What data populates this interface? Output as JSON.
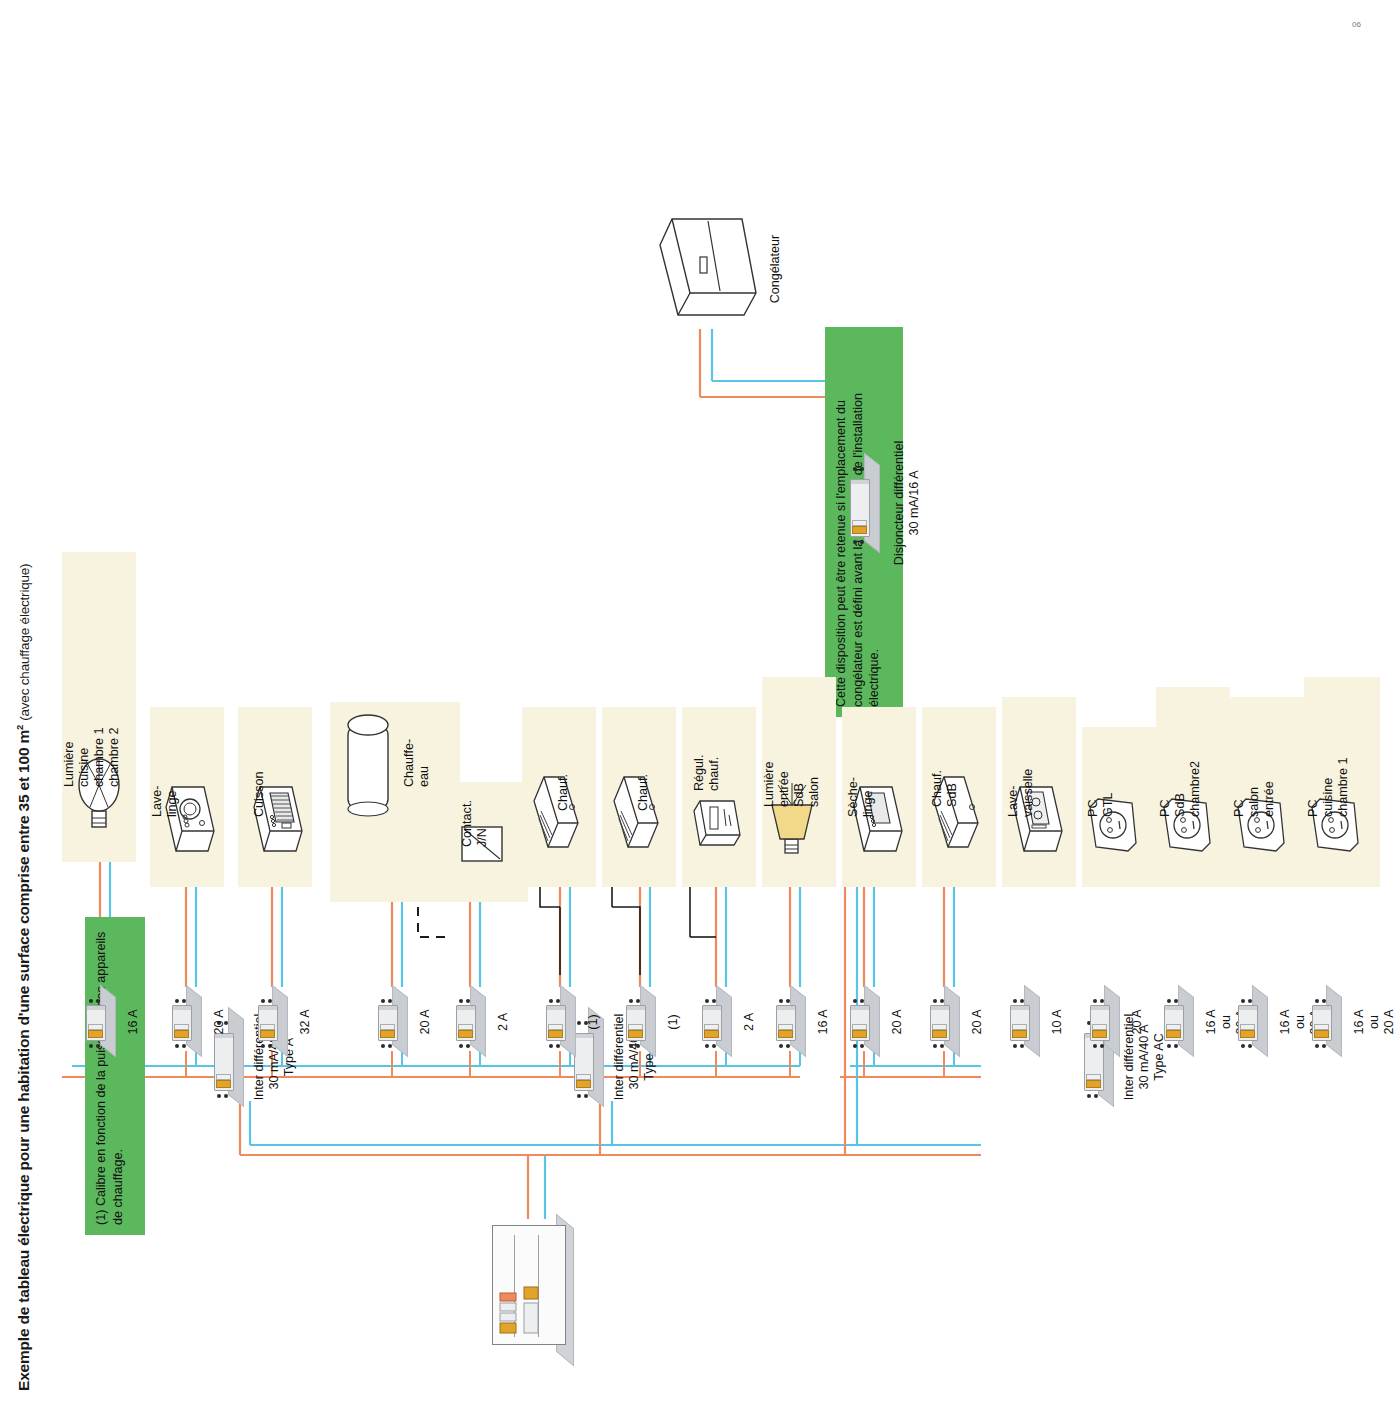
{
  "title": {
    "main": "Exemple de tableau électrique pour une habitation d'une surface comprise entre 35 et 100 m",
    "exponent": "2",
    "sub": "(avec chauffage électrique)"
  },
  "notes": {
    "note1": "(1) Calibre en fonction de la puissance des appareils de chauffage.",
    "note2": "Cette disposition peut être retenue si l'emplacement du congélateur est défini avant la réalisation de l'installation électrique."
  },
  "colors": {
    "note_green": "#5cb85c",
    "card_beige": "#f7f3de",
    "wire_phase": "#f08a5d",
    "wire_neutral": "#58c5e8",
    "wire_control": "#1a1a1a",
    "device_grey": "#c9cdd2",
    "lever_orange": "#e2a32b"
  },
  "interrupteurs": [
    {
      "id": "id-a",
      "line1": "Inter différentiel",
      "line2": "30 mA/40 A",
      "line3": "Type A"
    },
    {
      "id": "id-ac-1",
      "line1": "Inter différentiel",
      "line2": "30 mA/40 A",
      "line3": "Type AC"
    },
    {
      "id": "id-ac-2",
      "line1": "Inter différentiel",
      "line2": "30 mA/40 A",
      "line3": "Type AC"
    }
  ],
  "disjoncteur_differentiel": {
    "line1": "Disjoncteur différentiel",
    "line2": "30 mA/16 A"
  },
  "congelateur": {
    "label": "Congélateur"
  },
  "groups": [
    {
      "name": "group-type-a",
      "circuits": [
        {
          "amp": "16 A",
          "label": [
            "Lumière",
            "cuisine",
            "chambre 1",
            "chambre 2"
          ],
          "icon": "lamp-bulb-icon"
        },
        {
          "amp": "20 A",
          "label": [
            "Lave-",
            "linge"
          ],
          "icon": "washing-machine-icon"
        },
        {
          "amp": "32 A",
          "label": [
            "Cuisson"
          ],
          "icon": "cooker-icon"
        },
        {
          "amp": "20 A",
          "label": [
            "Chauffe-",
            "eau"
          ],
          "icon": "water-heater-icon"
        },
        {
          "amp": "2 A",
          "label": [
            "Contact.",
            "J/N"
          ],
          "icon": "contactor-icon"
        }
      ]
    },
    {
      "name": "group-type-ac-1",
      "circuits": [
        {
          "amp": "(1)",
          "label": [
            "Chauf."
          ],
          "icon": "convector-icon"
        },
        {
          "amp": "(1)",
          "label": [
            "Chauf."
          ],
          "icon": "convector-icon"
        },
        {
          "amp": "2 A",
          "label": [
            "Régul.",
            "chauf."
          ],
          "icon": "thermostat-icon"
        },
        {
          "amp": "16 A",
          "label": [
            "Lumière",
            "entrée",
            "SdB",
            "salon"
          ],
          "icon": "lamp-wall-icon"
        },
        {
          "amp": "20 A",
          "label": [
            "Sèche-",
            "linge"
          ],
          "icon": "tumble-dryer-icon"
        }
      ]
    },
    {
      "name": "group-type-ac-2",
      "circuits": [
        {
          "amp": "20 A",
          "label": [
            "Chauf.",
            "SdB"
          ],
          "icon": "convector-icon"
        },
        {
          "amp": "10 A",
          "label": [
            "Lave-",
            "vaisselle"
          ],
          "icon": "dishwasher-icon"
        },
        {
          "amp": "20 A",
          "label": [
            "PC",
            "GTL"
          ],
          "icon": "socket-icon"
        },
        {
          "amp": "16 A\nou\n20 A",
          "label": [
            "PC",
            "SdB",
            "chambre2"
          ],
          "icon": "socket-icon"
        },
        {
          "amp": "16 A\nou\n20 A",
          "label": [
            "PC",
            "salon",
            "entrée"
          ],
          "icon": "socket-icon"
        },
        {
          "amp": "16 A\nou\n20 A",
          "label": [
            "PC",
            "cuisine",
            "chambre 1"
          ],
          "icon": "socket-icon"
        }
      ]
    }
  ],
  "amps": {
    "c1": "16 A",
    "c2": "20 A",
    "c3": "32 A",
    "c4": "20 A",
    "c5": "2 A",
    "c6": "(1)",
    "c7": "(1)",
    "c8": "2 A",
    "c9": "16 A",
    "c10": "20 A",
    "c11": "20 A",
    "c12": "10 A",
    "c13": "20 A",
    "c14_a": "16 A",
    "c14_b": "ou",
    "c14_c": "20 A",
    "c15_a": "16 A",
    "c15_b": "ou",
    "c15_c": "20 A",
    "c16_a": "16 A",
    "c16_b": "ou",
    "c16_c": "20 A"
  },
  "labels": {
    "l1a": "Lumière",
    "l1b": "cuisine",
    "l1c": "chambre 1",
    "l1d": "chambre 2",
    "l2a": "Lave-",
    "l2b": "linge",
    "l3a": "Cuisson",
    "l4a": "Chauffe-",
    "l4b": "eau",
    "l5a": "Contact.",
    "l5b": "J/N",
    "l6a": "Chauf.",
    "l7a": "Chauf.",
    "l8a": "Régul.",
    "l8b": "chauf.",
    "l9a": "Lumière",
    "l9b": "entrée",
    "l9c": "SdB",
    "l9d": "salon",
    "l10a": "Sèche-",
    "l10b": "linge",
    "l11a": "Chauf.",
    "l11b": "SdB",
    "l12a": "Lave-",
    "l12b": "vaisselle",
    "l13a": "PC",
    "l13b": "GTL",
    "l14a": "PC",
    "l14b": "SdB",
    "l14c": "chambre2",
    "l15a": "PC",
    "l15b": "salon",
    "l15c": "entrée",
    "l16a": "PC",
    "l16b": "cuisine",
    "l16c": "chambre 1"
  },
  "page_mark": "06"
}
